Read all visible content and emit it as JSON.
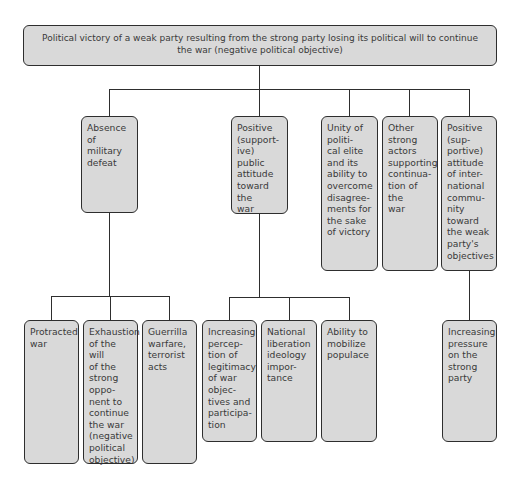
{
  "root": {
    "label": "Political victory of a weak party resulting from the strong party losing its political will to continue the war (negative political objective)"
  },
  "level2": [
    {
      "id": "absence-military-defeat",
      "label": "Absence\nof military\ndefeat"
    },
    {
      "id": "positive-public-attitude",
      "label": "Positive\n(support-\nive) public\nattitude\ntoward the\nwar"
    },
    {
      "id": "unity-political-elite",
      "label": "Unity of\npoliti-\ncal elite\nand its\nability to\novercome\ndisagree-\nments for\nthe sake\nof victory"
    },
    {
      "id": "other-strong-actors",
      "label": "Other\nstrong\nactors\nsupporting\ncontinua-\ntion of the\nwar"
    },
    {
      "id": "positive-international-attitude",
      "label": "Positive\n(sup-\nportive)\nattitude\nof inter-\nnational\ncommu-\nnity\ntoward\nthe weak\nparty's\nobjectives"
    }
  ],
  "level3": {
    "absence_military_defeat": [
      {
        "id": "protracted-war",
        "label": "Protracted\nwar"
      },
      {
        "id": "exhaustion-of-will",
        "label": "Exhaustion\nof the will\nof the\nstrong\noppo-\nnent to\ncontinue\nthe war\n(negative\npolitical\nobjective)"
      },
      {
        "id": "guerrilla-warfare",
        "label": "Guerrilla\nwarfare,\nterrorist\nacts"
      }
    ],
    "positive_public_attitude": [
      {
        "id": "legitimacy-perception",
        "label": "Increasing\npercep-\ntion of\nlegitimacy\nof war\nobjec-\ntives and\nparticipa-\ntion"
      },
      {
        "id": "national-liberation-ideology",
        "label": "National\nliberation\nideology\nimpor-\ntance"
      },
      {
        "id": "mobilize-populace",
        "label": "Ability to\nmobilize\npopulace"
      }
    ],
    "positive_international_attitude": [
      {
        "id": "pressure-strong-party",
        "label": "Increasing\npressure\non the\nstrong\nparty"
      }
    ]
  }
}
